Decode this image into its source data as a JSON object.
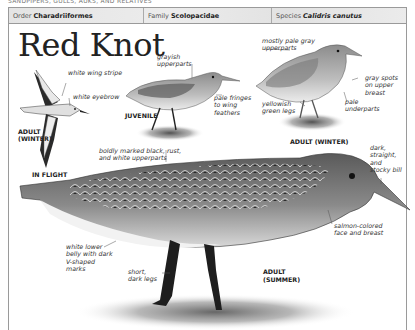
{
  "running_head": "SANDPIPERS, GULLS, AUKS, AND RELATIVES",
  "taxonomy": {
    "order_label": "Order",
    "order_value": "Charadriiformes",
    "family_label": "Family",
    "family_value": "Scolopacidae",
    "species_label": "Species",
    "species_value": "Calidris canutus"
  },
  "title": "Red Knot",
  "flight": {
    "annotations": [
      "white wing stripe",
      "white eyebrow"
    ],
    "age_label_line1": "ADULT",
    "age_label_line2": "(WINTER)",
    "caption": "IN FLIGHT"
  },
  "juvenile": {
    "annotations": [
      "grayish upperparts",
      "pale fringes to wing feathers"
    ],
    "label": "JUVENILE"
  },
  "adult_winter": {
    "annotations": [
      "mostly pale gray upperparts",
      "gray spots on upper breast",
      "yellowish green legs",
      "pale underparts"
    ],
    "label": "ADULT (WINTER)"
  },
  "adult_summer": {
    "annotations": [
      "boldly marked black, rust, and white upperparts",
      "dark, straight, and stocky bill",
      "salmon-colored face and breast",
      "white lower belly with dark V-shaped marks",
      "short, dark legs"
    ],
    "label_line1": "ADULT",
    "label_line2": "(SUMMER)"
  }
}
